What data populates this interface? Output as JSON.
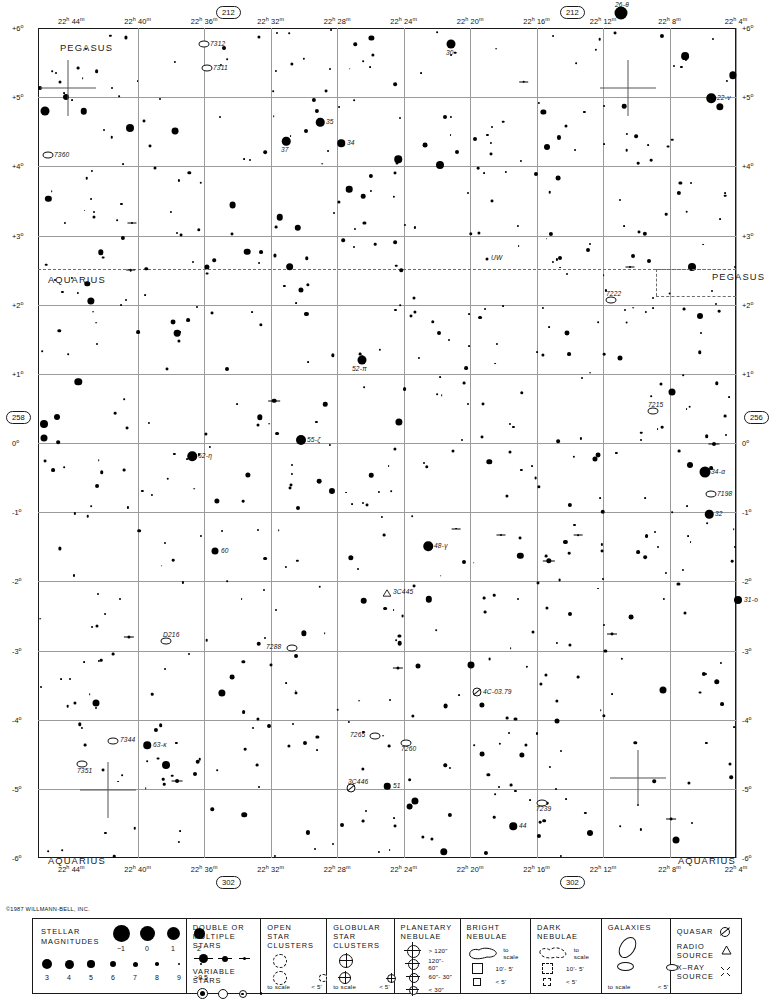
{
  "chart": {
    "copyright": "©1987 WILLMANN-BELL, INC.",
    "chart_number_top_left": "212",
    "chart_number_top_right": "212",
    "chart_number_bottom_left": "302",
    "chart_number_bottom_right": "302",
    "chart_number_left": "258",
    "chart_number_right": "256"
  },
  "chart_data": {
    "type": "scatter",
    "xlabel": "Right Ascension",
    "ylabel": "Declination",
    "xlim_hours": [
      22.0667,
      22.7667
    ],
    "ylim_deg": [
      -6,
      6
    ],
    "grid": true,
    "legend_position": "bottom",
    "ra_ticks": [
      {
        "label_h": "22",
        "label_m": "44",
        "hours": 22.7333
      },
      {
        "label_h": "22",
        "label_m": "40",
        "hours": 22.6667
      },
      {
        "label_h": "22",
        "label_m": "36",
        "hours": 22.6
      },
      {
        "label_h": "22",
        "label_m": "32",
        "hours": 22.5333
      },
      {
        "label_h": "22",
        "label_m": "28",
        "hours": 22.4667
      },
      {
        "label_h": "22",
        "label_m": "24",
        "hours": 22.4
      },
      {
        "label_h": "22",
        "label_m": "20",
        "hours": 22.3333
      },
      {
        "label_h": "22",
        "label_m": "16",
        "hours": 22.2667
      },
      {
        "label_h": "22",
        "label_m": "12",
        "hours": 22.2
      },
      {
        "label_h": "22",
        "label_m": "8",
        "hours": 22.1333
      },
      {
        "label_h": "22",
        "label_m": "4",
        "hours": 22.0667
      }
    ],
    "dec_ticks": [
      {
        "label": "+6°",
        "deg": 6
      },
      {
        "label": "+5°",
        "deg": 5
      },
      {
        "label": "+4°",
        "deg": 4
      },
      {
        "label": "+3°",
        "deg": 3
      },
      {
        "label": "+2°",
        "deg": 2
      },
      {
        "label": "+1°",
        "deg": 1
      },
      {
        "label": "0°",
        "deg": 0
      },
      {
        "label": "-1°",
        "deg": -1
      },
      {
        "label": "-2°",
        "deg": -2
      },
      {
        "label": "-3°",
        "deg": -3
      },
      {
        "label": "-4°",
        "deg": -4
      },
      {
        "label": "-5°",
        "deg": -5
      },
      {
        "label": "-6°",
        "deg": -6
      }
    ],
    "constellation_labels": [
      {
        "name": "PEGASUS",
        "x": 60,
        "y": 42
      },
      {
        "name": "PEGASUS",
        "x": 712,
        "y": 271
      },
      {
        "name": "AQUARIUS",
        "x": 48,
        "y": 274
      },
      {
        "name": "AQUARIUS",
        "x": 48,
        "y": 855
      },
      {
        "name": "AQUARIUS",
        "x": 678,
        "y": 855
      }
    ],
    "labeled_objects": [
      {
        "name": "7312",
        "type": "galaxy",
        "x": 204,
        "y": 44
      },
      {
        "name": "7311",
        "type": "galaxy",
        "x": 207,
        "y": 68
      },
      {
        "name": "7360",
        "type": "galaxy",
        "x": 48,
        "y": 155
      },
      {
        "name": "30",
        "type": "star",
        "x": 451,
        "y": 44
      },
      {
        "name": "26-θ",
        "type": "star",
        "x": 621,
        "y": 13
      },
      {
        "name": "22-ν",
        "type": "star",
        "x": 711,
        "y": 98
      },
      {
        "name": "35",
        "type": "star",
        "x": 320,
        "y": 122
      },
      {
        "name": "37",
        "type": "star",
        "x": 286,
        "y": 141
      },
      {
        "name": "34",
        "type": "star",
        "x": 341,
        "y": 143
      },
      {
        "name": "UW",
        "type": "variable-star",
        "x": 487,
        "y": 259
      },
      {
        "name": "7222",
        "type": "galaxy",
        "x": 611,
        "y": 300
      },
      {
        "name": "7215",
        "type": "galaxy",
        "x": 653,
        "y": 411
      },
      {
        "name": "52-π",
        "type": "star",
        "x": 362,
        "y": 360
      },
      {
        "name": "55-ζ",
        "type": "star",
        "x": 301,
        "y": 440
      },
      {
        "name": "62-η",
        "type": "star",
        "x": 192,
        "y": 456
      },
      {
        "name": "34-α",
        "type": "star",
        "x": 705,
        "y": 472
      },
      {
        "name": "7198",
        "type": "galaxy",
        "x": 711,
        "y": 494
      },
      {
        "name": "32",
        "type": "star",
        "x": 709,
        "y": 514
      },
      {
        "name": "48-γ",
        "type": "star",
        "x": 428,
        "y": 546
      },
      {
        "name": "60",
        "type": "star",
        "x": 215,
        "y": 551
      },
      {
        "name": "3C445",
        "type": "radio-source",
        "x": 387,
        "y": 592
      },
      {
        "name": "31-ο",
        "type": "star",
        "x": 738,
        "y": 600
      },
      {
        "name": "D216",
        "type": "galaxy",
        "x": 166,
        "y": 641
      },
      {
        "name": "7288",
        "type": "galaxy",
        "x": 292,
        "y": 648
      },
      {
        "name": "4C-03.79",
        "type": "quasar",
        "x": 477,
        "y": 692
      },
      {
        "name": "7344",
        "type": "galaxy",
        "x": 113,
        "y": 741
      },
      {
        "name": "63-κ",
        "type": "star",
        "x": 147,
        "y": 745
      },
      {
        "name": "7265",
        "type": "galaxy",
        "x": 375,
        "y": 736
      },
      {
        "name": "7260",
        "type": "galaxy",
        "x": 406,
        "y": 743
      },
      {
        "name": "7351",
        "type": "galaxy",
        "x": 82,
        "y": 764
      },
      {
        "name": "3C446",
        "type": "quasar",
        "x": 351,
        "y": 788
      },
      {
        "name": "51",
        "type": "star",
        "x": 387,
        "y": 786
      },
      {
        "name": "7239",
        "type": "galaxy",
        "x": 542,
        "y": 803
      },
      {
        "name": "44",
        "type": "star",
        "x": 513,
        "y": 826
      }
    ]
  },
  "legend": {
    "stellar_magnitudes": {
      "title_line1": "STELLAR",
      "title_line2": "MAGNITUDES",
      "row1": [
        {
          "label": "−1",
          "size": 17
        },
        {
          "label": "0",
          "size": 15
        },
        {
          "label": "1",
          "size": 13
        },
        {
          "label": "2",
          "size": 11
        }
      ],
      "row2": [
        {
          "label": "3",
          "size": 10
        },
        {
          "label": "4",
          "size": 9
        },
        {
          "label": "5",
          "size": 7.5
        },
        {
          "label": "6",
          "size": 6
        },
        {
          "label": "7",
          "size": 5
        },
        {
          "label": "8",
          "size": 3.6
        },
        {
          "label": "9",
          "size": 2.6
        },
        {
          "label": ">9.5",
          "size": 1.8
        }
      ]
    },
    "double_stars": {
      "title_line1": "DOUBLE OR",
      "title_line2": "MULTIPLE STARS",
      "variable_title": "VARIABLE STARS"
    },
    "open_clusters": {
      "title_line1": "OPEN",
      "title_line2": "STAR CLUSTERS",
      "scale_label": "to scale",
      "small_label": "< 5'"
    },
    "globular_clusters": {
      "title_line1": "GLOBULAR",
      "title_line2": "STAR CLUSTERS",
      "scale_label": "to scale",
      "small_label": "< 5'"
    },
    "planetary_nebulae": {
      "title_line1": "PLANETARY",
      "title_line2": "NEBULAE",
      "sizes": [
        "> 120\"",
        "120\"- 60\"",
        "60\"- 30\"",
        "< 30\""
      ]
    },
    "bright_nebulae": {
      "title_line1": "BRIGHT",
      "title_line2": "NEBULAE",
      "scale_label": "to scale",
      "mid_label": "10'- 5'",
      "small_label": "< 5'"
    },
    "dark_nebulae": {
      "title_line1": "DARK",
      "title_line2": "NEBULAE",
      "scale_label": "to scale",
      "mid_label": "10'- 5'",
      "small_label": "< 5'"
    },
    "galaxies": {
      "title_line1": "GALAXIES",
      "scale_label": "to scale",
      "small_label": "< 5'"
    },
    "other_sources": {
      "quasar_label": "QUASAR",
      "radio_line1": "RADIO",
      "radio_line2": "SOURCE",
      "xray_line1": "X–RAY",
      "xray_line2": "SOURCE"
    }
  }
}
